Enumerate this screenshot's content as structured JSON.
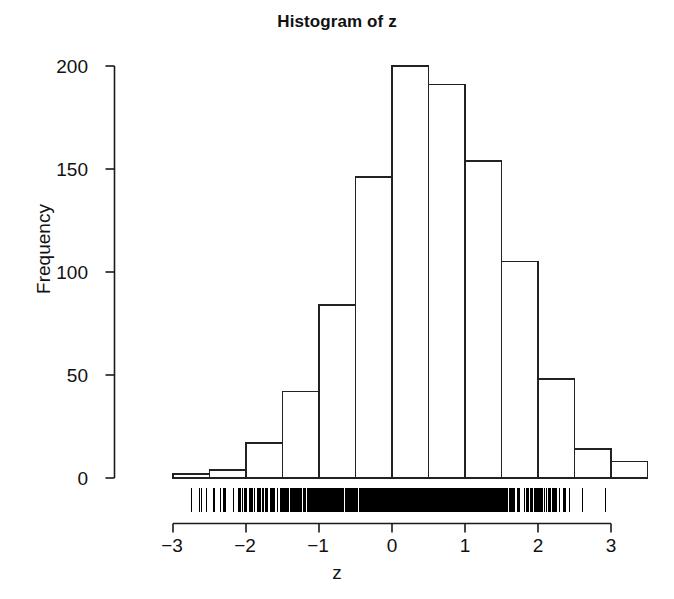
{
  "figure": {
    "title": "Histogram of z",
    "xlabel": "z",
    "ylabel": "Frequency"
  },
  "axes": {
    "y_ticks": [
      "0",
      "50",
      "100",
      "150",
      "200"
    ],
    "x_ticks": [
      "−3",
      "−2",
      "−1",
      "0",
      "1",
      "2",
      "3"
    ]
  },
  "colors": {
    "foreground": "#1a1a1a",
    "background": "#ffffff",
    "bar_stroke": "#222222",
    "bar_fill": "#ffffff",
    "rug": "#000000"
  },
  "chart_data": {
    "type": "bar",
    "title": "Histogram of z",
    "xlabel": "z",
    "ylabel": "Frequency",
    "xlim": [
      -3.2,
      3.7
    ],
    "ylim": [
      0,
      200
    ],
    "grid": false,
    "legend": null,
    "bin_width": 0.5,
    "bin_edges": [
      -3.0,
      -2.5,
      -2.0,
      -1.5,
      -1.0,
      -0.5,
      0.0,
      0.5,
      1.0,
      1.5,
      2.0,
      2.5,
      3.0,
      3.5
    ],
    "categories": [
      "[-3.0,-2.5)",
      "[-2.5,-2.0)",
      "[-2.0,-1.5)",
      "[-1.5,-1.0)",
      "[-1.0,-0.5)",
      "[-0.5,0.0)",
      "[0.0,0.5)",
      "[0.5,1.0)",
      "[1.0,1.5)",
      "[1.5,2.0)",
      "[2.0,2.5)",
      "[2.5,3.0)",
      "[3.0,3.5)"
    ],
    "values": [
      2,
      4,
      17,
      42,
      84,
      146,
      200,
      191,
      154,
      105,
      48,
      14,
      8
    ],
    "annotations": [
      "rug plot of individual z observations drawn along the x axis baseline"
    ]
  }
}
